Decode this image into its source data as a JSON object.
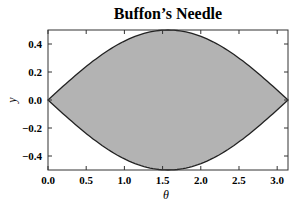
{
  "chart_data": {
    "type": "area",
    "title": "Buffon’s Needle",
    "xlabel": "θ",
    "ylabel": "y",
    "xlim": [
      0,
      3.14159
    ],
    "ylim": [
      -0.5,
      0.5
    ],
    "xticks": [
      "0.0",
      "0.5",
      "1.0",
      "1.5",
      "2.0",
      "2.5",
      "3.0"
    ],
    "yticks": [
      "-0.4",
      "-0.2",
      "0.0",
      "0.2",
      "0.4"
    ],
    "grid": false,
    "legend": null,
    "series": [
      {
        "name": "upper",
        "function": "0.5*sin(theta)",
        "x": [
          0,
          0.5,
          1.0,
          1.5708,
          2.0,
          2.5,
          3.1416
        ],
        "values": [
          0,
          0.24,
          0.42,
          0.5,
          0.45,
          0.3,
          0
        ]
      },
      {
        "name": "lower",
        "function": "-0.5*sin(theta)",
        "x": [
          0,
          0.5,
          1.0,
          1.5708,
          2.0,
          2.5,
          3.1416
        ],
        "values": [
          0,
          -0.24,
          -0.42,
          -0.5,
          -0.45,
          -0.3,
          0
        ]
      }
    ],
    "fill_color": "#b3b3b3",
    "line_color": "#222222"
  }
}
